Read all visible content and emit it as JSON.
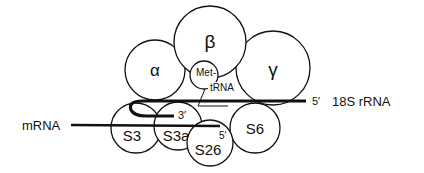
{
  "diagram": {
    "subunits": {
      "alpha": "α",
      "beta": "β",
      "gamma": "γ"
    },
    "met_trna": {
      "line1": "Met-",
      "line2": "tRNA"
    },
    "rrna": {
      "end_5prime": "5′",
      "end_3prime": "3′",
      "label": "18S rRNA"
    },
    "mrna": {
      "label": "mRNA",
      "end_5prime": "5′"
    },
    "ribosomal_proteins": [
      "S3",
      "S3a",
      "S26",
      "S6"
    ],
    "colors": {
      "stroke": "#111111",
      "background": "#ffffff"
    }
  }
}
